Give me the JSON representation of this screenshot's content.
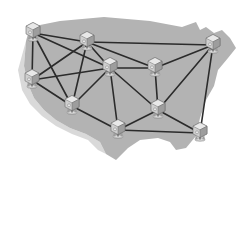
{
  "canvas": {
    "width": 245,
    "height": 243
  },
  "colors": {
    "background": "#ffffff",
    "map_fill": "#b3b3b3",
    "map_shadow": "#d9d9d9",
    "link": "#2b2b2b",
    "node_body": "#cfcfcf",
    "node_top": "#e8e8e8",
    "node_side": "#9d9d9d",
    "node_outline": "#6a6a6a",
    "node_base": "#dcdcdc"
  },
  "map": {
    "name": "united-states-silhouette",
    "outline_path": "M26,41 L30,27 L60,21 L104,17 L150,21 L182,27 L196,22 L200,30 L206,27 L214,33 L222,30 L230,38 L236,48 L228,58 L218,70 L214,86 L206,100 L200,118 L196,136 L186,148 L176,150 L170,142 L158,138 L140,140 L128,148 L116,160 L106,154 L100,142 L86,134 L70,128 L56,120 L44,110 L34,98 L28,84 L24,66 Z",
    "shadow_path": "M24,48 L28,34 L30,27 L26,41 L24,66 L28,84 L34,98 L44,110 L56,120 L70,128 L86,134 L100,142 L106,154 L98,150 L88,140 L72,134 L56,126 L42,116 L30,104 L22,90 L18,70 Z"
  },
  "network": {
    "node_icon": "server-node-icon",
    "nodes": [
      {
        "id": "n1",
        "name": "node-northwest",
        "x": 33,
        "y": 33
      },
      {
        "id": "n2",
        "name": "node-north-central",
        "x": 87,
        "y": 42
      },
      {
        "id": "n3",
        "name": "node-northeast",
        "x": 213,
        "y": 45
      },
      {
        "id": "n4",
        "name": "node-west",
        "x": 32,
        "y": 80
      },
      {
        "id": "n5",
        "name": "node-mountain",
        "x": 110,
        "y": 68
      },
      {
        "id": "n6",
        "name": "node-midwest",
        "x": 155,
        "y": 68
      },
      {
        "id": "n7",
        "name": "node-southwest",
        "x": 72,
        "y": 106
      },
      {
        "id": "n8",
        "name": "node-south-central",
        "x": 118,
        "y": 130
      },
      {
        "id": "n9",
        "name": "node-southeast-mid",
        "x": 158,
        "y": 110
      },
      {
        "id": "n10",
        "name": "node-southeast",
        "x": 200,
        "y": 133
      }
    ],
    "links": [
      {
        "from": "n1",
        "to": "n2"
      },
      {
        "from": "n1",
        "to": "n4"
      },
      {
        "from": "n1",
        "to": "n5"
      },
      {
        "from": "n1",
        "to": "n7"
      },
      {
        "from": "n2",
        "to": "n3"
      },
      {
        "from": "n2",
        "to": "n5"
      },
      {
        "from": "n2",
        "to": "n4"
      },
      {
        "from": "n2",
        "to": "n7"
      },
      {
        "from": "n2",
        "to": "n6"
      },
      {
        "from": "n3",
        "to": "n6"
      },
      {
        "from": "n3",
        "to": "n9"
      },
      {
        "from": "n3",
        "to": "n10"
      },
      {
        "from": "n4",
        "to": "n5"
      },
      {
        "from": "n4",
        "to": "n7"
      },
      {
        "from": "n5",
        "to": "n6"
      },
      {
        "from": "n5",
        "to": "n7"
      },
      {
        "from": "n5",
        "to": "n8"
      },
      {
        "from": "n5",
        "to": "n9"
      },
      {
        "from": "n6",
        "to": "n9"
      },
      {
        "from": "n7",
        "to": "n8"
      },
      {
        "from": "n8",
        "to": "n9"
      },
      {
        "from": "n8",
        "to": "n10"
      },
      {
        "from": "n9",
        "to": "n10"
      }
    ]
  }
}
